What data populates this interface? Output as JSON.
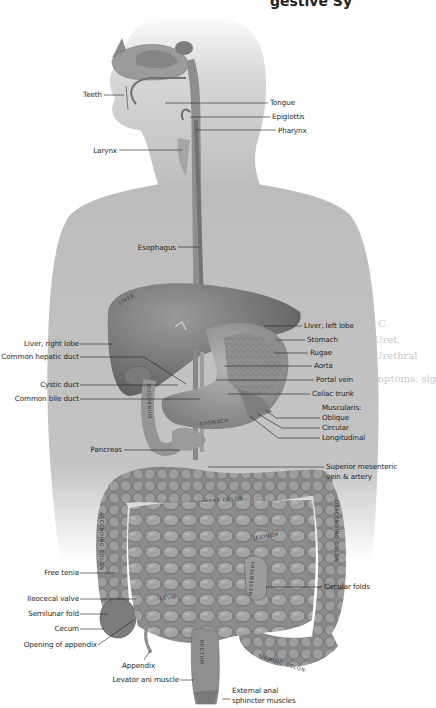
{
  "header": {
    "title_fragment": "gestive Sy"
  },
  "background_bleed_text": [
    "C",
    "Uret.",
    "Urethral",
    "Symptoms, sig"
  ],
  "labels": {
    "teeth": "Teeth",
    "tongue": "Tongue",
    "epiglottis": "Epiglottis",
    "pharynx": "Pharynx",
    "larynx": "Larynx",
    "esophagus": "Esophagus",
    "liver_right_lobe": "Liver, right lobe",
    "common_hepatic_duct": "Common hepatic duct",
    "cystic_duct": "Cystic duct",
    "common_bile_duct": "Common bile duct",
    "liver_left_lobe": "Liver, left lobe",
    "stomach": "Stomach",
    "rugae": "Rugae",
    "aorta": "Aorta",
    "portal_vein": "Portal vein",
    "celiac_trunk": "Celiac trunk",
    "muscularis": "Muscularis:",
    "oblique": "Oblique",
    "circular": "Circular",
    "longitudinal": "Longitudinal",
    "pancreas": "Pancreas",
    "superior_mesenteric_1": "Superior mesenteric",
    "superior_mesenteric_2": "vein & artery",
    "free_tenia": "Free tenia",
    "ileocecal_valve": "Ileocecal valve",
    "semilunar_fold": "Semilunar fold",
    "cecum": "Cecum",
    "opening_of_appendix": "Opening of appendix",
    "appendix": "Appendix",
    "levator_ani": "Levator ani muscle",
    "circular_folds": "Circular folds",
    "external_anal_1": "External anal",
    "external_anal_2": "sphincter muscles"
  },
  "organ_text": {
    "liver": "LIVER",
    "duodenum": "DUODENUM",
    "stomach": "STOMACH",
    "transverse_colon": "TRANSVERSE COLON",
    "ascending_colon": "ASCENDING COLON",
    "descending_colon": "DESCENDING COLON",
    "jejunum": "JEJUNUM",
    "ileum": "ILEUM",
    "rectum": "RECTUM",
    "sigmoid_colon": "SIGMOID COLON",
    "mesentery": "MESENTERY"
  },
  "colors": {
    "silhouette": "#b9b9b9",
    "organ_dark": "#6e6e6e",
    "organ_mid": "#8f8f8f",
    "organ_light": "#a8a8a8",
    "leader_line": "#1e1e1e",
    "background": "#ffffff"
  }
}
